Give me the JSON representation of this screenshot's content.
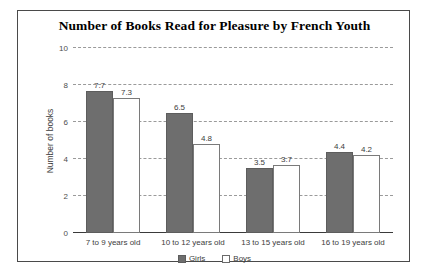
{
  "chart_data": {
    "type": "bar",
    "title": "Number of Books Read for Pleasure by French Youth",
    "xlabel": "",
    "ylabel": "Number of books",
    "categories": [
      "7 to 9 years old",
      "10 to 12 years old",
      "13 to 15 years old",
      "16 to 19 years old"
    ],
    "series": [
      {
        "name": "Girls",
        "color": "#6e6e6e",
        "values": [
          7.7,
          6.5,
          3.5,
          4.4
        ]
      },
      {
        "name": "Boys",
        "color": "#ffffff",
        "values": [
          7.3,
          4.8,
          3.7,
          4.2
        ]
      }
    ],
    "ylim": [
      0,
      10
    ],
    "yticks": [
      0,
      2,
      4,
      6,
      8,
      10
    ],
    "ytick_labels": [
      "0",
      "2",
      "4",
      "6",
      "8",
      "10"
    ],
    "grid": true,
    "grid_style": "dashed",
    "legend_position": "bottom",
    "data_labels": true
  },
  "legend": {
    "items": [
      {
        "label": "Girls"
      },
      {
        "label": "Boys"
      }
    ]
  }
}
